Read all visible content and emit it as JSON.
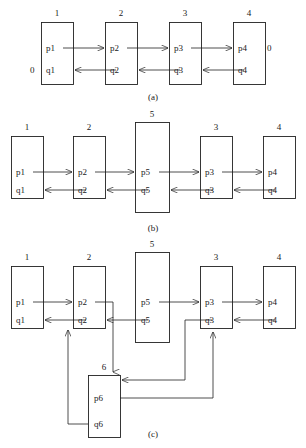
{
  "figure": {
    "caption_a": "(a)",
    "caption_b": "(b)",
    "caption_c": "(c)"
  },
  "panels": [
    {
      "id": "a",
      "caption": "(a)",
      "boxes": [
        {
          "id": "a1",
          "number": "1",
          "top_port": "p1",
          "bottom_port": "q1",
          "external_left": "0",
          "external_right": ""
        },
        {
          "id": "a2",
          "number": "2",
          "top_port": "p2",
          "bottom_port": "q2",
          "external_left": "",
          "external_right": ""
        },
        {
          "id": "a3",
          "number": "3",
          "top_port": "p3",
          "bottom_port": "q3",
          "external_left": "",
          "external_right": ""
        },
        {
          "id": "a4",
          "number": "4",
          "top_port": "p4",
          "bottom_port": "q4",
          "external_left": "",
          "external_right": "0"
        }
      ]
    },
    {
      "id": "b",
      "caption": "(b)",
      "boxes": [
        {
          "id": "b1",
          "number": "1",
          "top_port": "p1",
          "bottom_port": "q1"
        },
        {
          "id": "b2",
          "number": "2",
          "top_port": "p2",
          "bottom_port": "q2"
        },
        {
          "id": "b5",
          "number": "5",
          "top_port": "p5",
          "bottom_port": "q5"
        },
        {
          "id": "b3",
          "number": "3",
          "top_port": "p3",
          "bottom_port": "q3"
        },
        {
          "id": "b4",
          "number": "4",
          "top_port": "p4",
          "bottom_port": "q4"
        }
      ]
    },
    {
      "id": "c",
      "caption": "(c)",
      "boxes": [
        {
          "id": "c1",
          "number": "1",
          "top_port": "p1",
          "bottom_port": "q1"
        },
        {
          "id": "c2",
          "number": "2",
          "top_port": "p2",
          "bottom_port": "q2"
        },
        {
          "id": "c5",
          "number": "5",
          "top_port": "p5",
          "bottom_port": "q5"
        },
        {
          "id": "c3",
          "number": "3",
          "top_port": "p3",
          "bottom_port": "q3"
        },
        {
          "id": "c4",
          "number": "4",
          "top_port": "p4",
          "bottom_port": "q4"
        },
        {
          "id": "c6",
          "number": "6",
          "top_port": "p6",
          "bottom_port": "q6"
        }
      ]
    }
  ],
  "colors": {
    "stroke": "#222222",
    "text": "#1a1a1a",
    "background": "#ffffff"
  }
}
